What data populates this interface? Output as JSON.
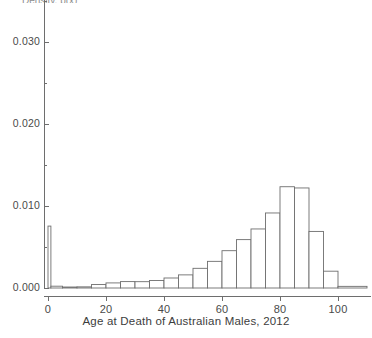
{
  "figure": {
    "background": "#ffffff",
    "line_color": "#6e6e6e",
    "text_color": "#3d3d3d",
    "clipped_top_text": "Density, p(x)"
  },
  "axes": {
    "x_title": "Age at Death of Australian Males, 2012",
    "x_ticks": [
      "0",
      "20",
      "40",
      "60",
      "80",
      "100"
    ],
    "y_ticks": [
      "0.000",
      "0.010",
      "0.020",
      "0.030"
    ]
  },
  "chart_data": {
    "type": "bar",
    "title": "",
    "subtitle": "",
    "xlabel": "Age at Death of Australian Males, 2012",
    "ylabel": "",
    "xlim": [
      -2,
      112
    ],
    "ylim": [
      0.0,
      0.0355
    ],
    "grid": false,
    "legend": "none",
    "x_tick_values": [
      0,
      20,
      40,
      60,
      80,
      100
    ],
    "x_tick_labels": [
      "0",
      "20",
      "40",
      "60",
      "80",
      "100"
    ],
    "x_minor_tick_values": [
      10,
      30,
      50,
      70,
      90
    ],
    "y_tick_values": [
      0.0,
      0.01,
      0.02,
      0.03
    ],
    "y_tick_labels": [
      "0.000",
      "0.010",
      "0.020",
      "0.030"
    ],
    "y_minor_tick_values": [
      0.005,
      0.015,
      0.025,
      0.035
    ],
    "bar_edge_color": "#6e6e6e",
    "bar_fill_color": "#ffffff",
    "bins": [
      {
        "label": "0-1",
        "x0": 0,
        "x1": 1,
        "value": 0.00755
      },
      {
        "label": "1-5",
        "x0": 1,
        "x1": 5,
        "value": 0.00022
      },
      {
        "label": "5-10",
        "x0": 5,
        "x1": 10,
        "value": 0.00012
      },
      {
        "label": "10-15",
        "x0": 10,
        "x1": 15,
        "value": 0.00014
      },
      {
        "label": "15-20",
        "x0": 15,
        "x1": 20,
        "value": 0.00042
      },
      {
        "label": "20-25",
        "x0": 20,
        "x1": 25,
        "value": 0.00062
      },
      {
        "label": "25-30",
        "x0": 25,
        "x1": 30,
        "value": 0.00078
      },
      {
        "label": "30-35",
        "x0": 30,
        "x1": 35,
        "value": 0.00077
      },
      {
        "label": "35-40",
        "x0": 35,
        "x1": 40,
        "value": 0.00092
      },
      {
        "label": "40-45",
        "x0": 40,
        "x1": 45,
        "value": 0.00122
      },
      {
        "label": "45-50",
        "x0": 45,
        "x1": 50,
        "value": 0.0016
      },
      {
        "label": "50-55",
        "x0": 50,
        "x1": 55,
        "value": 0.0024
      },
      {
        "label": "55-60",
        "x0": 55,
        "x1": 60,
        "value": 0.00325
      },
      {
        "label": "60-65",
        "x0": 60,
        "x1": 65,
        "value": 0.00455
      },
      {
        "label": "65-70",
        "x0": 65,
        "x1": 70,
        "value": 0.0059
      },
      {
        "label": "70-75",
        "x0": 70,
        "x1": 75,
        "value": 0.0072
      },
      {
        "label": "75-80",
        "x0": 75,
        "x1": 80,
        "value": 0.00915
      },
      {
        "label": "80-85",
        "x0": 80,
        "x1": 85,
        "value": 0.01235
      },
      {
        "label": "85-90",
        "x0": 85,
        "x1": 90,
        "value": 0.0122
      },
      {
        "label": "90-95",
        "x0": 90,
        "x1": 95,
        "value": 0.0069
      },
      {
        "label": "95-100",
        "x0": 95,
        "x1": 100,
        "value": 0.00205
      },
      {
        "label": "100-110",
        "x0": 100,
        "x1": 110,
        "value": 0.0002
      }
    ],
    "peak_bin": "80-85",
    "peak_value": 0.01235
  }
}
